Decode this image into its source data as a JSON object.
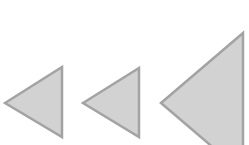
{
  "diagram": {
    "fill_color": "#d2d2d2",
    "stroke_color": "#a3a3a3",
    "shapes": [
      {
        "name": "small-left-triangle",
        "points": "5,103 62,67 62,137"
      },
      {
        "name": "medium-left-triangle",
        "points": "83,103 139,68 139,137"
      },
      {
        "name": "large-left-triangle",
        "points": "161,103 243,33 243,173"
      }
    ]
  }
}
